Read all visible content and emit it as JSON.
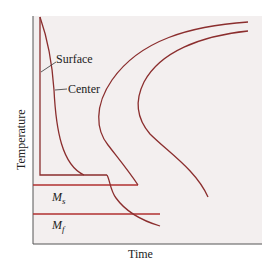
{
  "diagram": {
    "type": "cooling-curves-on-transformation-diagram",
    "axes": {
      "xlabel": "Time",
      "ylabel": "Temperature"
    },
    "labels": {
      "surface": "Surface",
      "center": "Center",
      "ms": "M",
      "ms_sub": "s",
      "mf": "M",
      "mf_sub": "f"
    },
    "colors": {
      "background": "#f2eeee",
      "curve": "#8b2e2e",
      "ms_line": "#b03030",
      "axis": "#555555",
      "text": "#222222"
    }
  }
}
